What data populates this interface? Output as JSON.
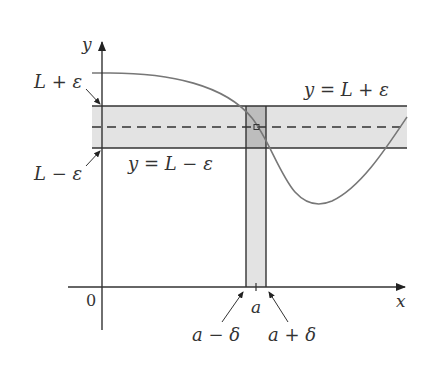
{
  "figure": {
    "type": "epsilon-delta limit diagram",
    "axes": {
      "x_label": "x",
      "y_label": "y",
      "origin_label": "0"
    },
    "horizontal_band": {
      "upper_label": "L + ε",
      "lower_label": "L − ε",
      "upper_line_label": "y = L + ε",
      "lower_line_label": "y = L − ε",
      "center_line": "y = L (dashed)"
    },
    "vertical_strip": {
      "center_label": "a",
      "left_label": "a − δ",
      "right_label": "a + δ"
    },
    "colors": {
      "band_fill": "#e3e3e3",
      "overlap_fill": "#bdbdbd",
      "line": "#333333",
      "curve": "#777777",
      "background": "#ffffff"
    }
  }
}
